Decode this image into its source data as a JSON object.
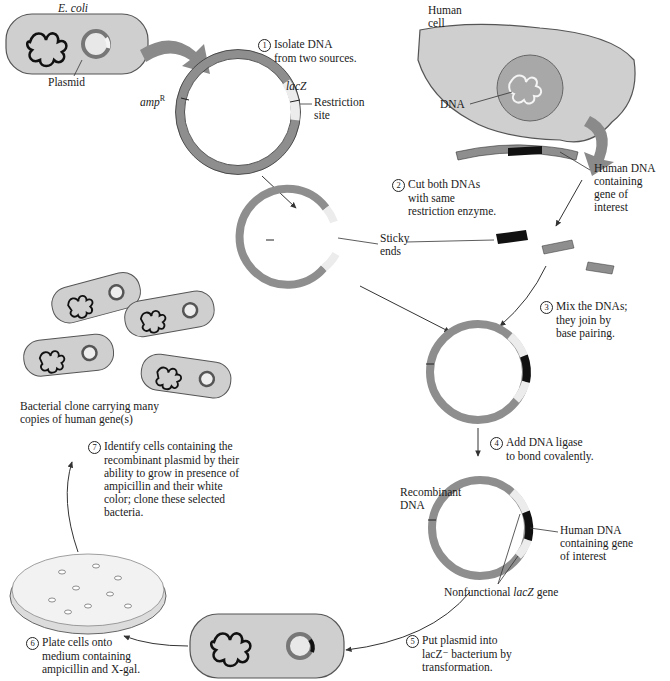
{
  "colors": {
    "cell_fill": "#cfcfcf",
    "cell_stroke": "#555555",
    "plasmid_gray": "#8e8e8e",
    "lacz_light": "#ececec",
    "human_dna_black": "#111111",
    "arrow_gray": "#8a8a8a",
    "nucleus_fill": "#a8a8a8",
    "plate_fill": "#f2f2f2"
  },
  "labels": {
    "ecoli": "E. coli",
    "plasmid": "Plasmid",
    "amp_r": "amp",
    "amp_r_sup": "R",
    "lacz": "lacZ",
    "restriction_site_1": "Restriction",
    "restriction_site_2": "site",
    "human_cell_1": "Human",
    "human_cell_2": "cell",
    "dna": "DNA",
    "human_dna_goi_1": "Human DNA",
    "human_dna_goi_2": "containing",
    "human_dna_goi_3": "gene of",
    "human_dna_goi_4": "interest",
    "sticky_ends_1": "Sticky",
    "sticky_ends_2": "ends",
    "recombinant_1": "Recombinant",
    "recombinant_2": "DNA",
    "human_dna_goi2_1": "Human DNA",
    "human_dna_goi2_2": "containing gene",
    "human_dna_goi2_3": "of interest",
    "nonfunctional_lacz_pre": "Nonfunctional ",
    "nonfunctional_lacz_italic": "lacZ",
    "nonfunctional_lacz_post": " gene",
    "clone_1": "Bacterial clone carrying many",
    "clone_2": "copies of human gene(s)"
  },
  "steps": [
    {
      "num": "1",
      "lines": [
        "Isolate DNA",
        "from two sources."
      ]
    },
    {
      "num": "2",
      "lines": [
        "Cut both DNAs",
        "with same",
        "restriction enzyme."
      ]
    },
    {
      "num": "3",
      "lines": [
        "Mix the DNAs;",
        "they join by",
        "base pairing."
      ]
    },
    {
      "num": "4",
      "lines": [
        "Add DNA ligase",
        "to bond covalently."
      ]
    },
    {
      "num": "5",
      "lines": [
        "Put plasmid into",
        "lacZ⁻ bacterium by",
        "transformation."
      ]
    },
    {
      "num": "6",
      "lines": [
        "Plate cells onto",
        "medium containing",
        "ampicillin and X-gal."
      ]
    },
    {
      "num": "7",
      "lines": [
        "Identify cells containing the",
        "recombinant plasmid by their",
        "ability to grow in presence of",
        "ampicillin and their white",
        "color; clone these selected",
        "bacteria."
      ]
    }
  ]
}
